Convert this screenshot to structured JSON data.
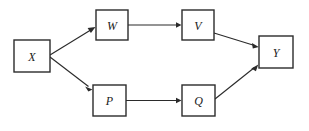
{
  "diagram": {
    "type": "directed-acyclic-graph",
    "title": "",
    "background_color": "#ffffff",
    "node_fill": "#ffffff",
    "node_stroke": "#2b2b2b",
    "edge_color": "#2b2b2b",
    "label_color": "#1a1a1a",
    "nodes": [
      {
        "id": "X",
        "label": "X",
        "x": 14,
        "y": 40,
        "w": 36,
        "h": 32
      },
      {
        "id": "W",
        "label": "W",
        "x": 96,
        "y": 10,
        "w": 32,
        "h": 30
      },
      {
        "id": "V",
        "label": "V",
        "x": 182,
        "y": 10,
        "w": 32,
        "h": 30
      },
      {
        "id": "Y",
        "label": "Y",
        "x": 259,
        "y": 36,
        "w": 34,
        "h": 32
      },
      {
        "id": "P",
        "label": "P",
        "x": 93,
        "y": 85,
        "w": 33,
        "h": 31
      },
      {
        "id": "Q",
        "label": "Q",
        "x": 182,
        "y": 85,
        "w": 33,
        "h": 31
      }
    ],
    "edges": [
      {
        "from": "X",
        "to": "W",
        "label": "",
        "directed": true
      },
      {
        "from": "X",
        "to": "P",
        "label": "",
        "directed": true
      },
      {
        "from": "W",
        "to": "V",
        "label": "",
        "directed": true
      },
      {
        "from": "P",
        "to": "Q",
        "label": "",
        "directed": true
      },
      {
        "from": "V",
        "to": "Y",
        "label": "",
        "directed": true
      },
      {
        "from": "Q",
        "to": "Y",
        "label": "",
        "directed": true
      }
    ]
  }
}
